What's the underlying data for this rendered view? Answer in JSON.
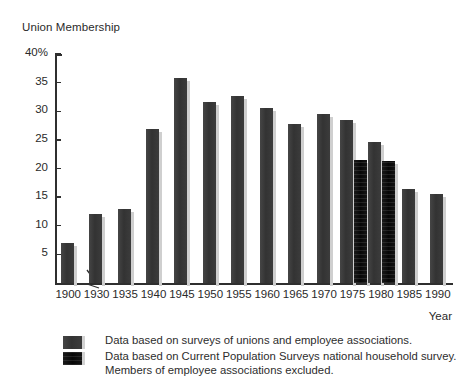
{
  "chart_data": {
    "type": "bar",
    "title": "Union Membership",
    "xlabel": "Year",
    "ylabel": "",
    "ylim": [
      0,
      40
    ],
    "yticks": [
      40,
      35,
      30,
      25,
      20,
      15,
      10,
      5
    ],
    "ytick_labels": [
      "40%",
      "35",
      "30",
      "25",
      "20",
      "15",
      "10",
      "5"
    ],
    "grid": false,
    "axis_break_after_category": "1900",
    "legend_position": "below-plot",
    "categories": [
      "1900",
      "1930",
      "1935",
      "1940",
      "1945",
      "1950",
      "1955",
      "1960",
      "1965",
      "1970",
      "1975",
      "1980",
      "1985",
      "1990"
    ],
    "series": [
      {
        "name": "Data based on surveys of unions and employee associations.",
        "key": "unions",
        "color": "#3a3a3a",
        "values": [
          7.0,
          12.0,
          13.0,
          26.9,
          35.8,
          31.7,
          32.6,
          30.6,
          27.7,
          29.6,
          28.4,
          24.7,
          16.5,
          15.5
        ]
      },
      {
        "name": "Data based on Current Population Surveys national household survey. Members of employee associations excluded.",
        "key": "cps",
        "color": "#111111",
        "values": [
          null,
          null,
          null,
          null,
          null,
          null,
          null,
          null,
          null,
          null,
          21.5,
          21.3,
          null,
          null
        ]
      }
    ]
  },
  "legend": {
    "entries": [
      {
        "label": "Data based on surveys of unions and employee associations.",
        "swatch": "unions"
      },
      {
        "label": "Data based on Current Population Surveys national household survey.",
        "swatch": "cps"
      },
      {
        "label": "Members of employee associations excluded.",
        "swatch": null
      }
    ]
  },
  "colors": {
    "series_unions": "#3a3a3a",
    "series_cps": "#111111",
    "axis": "#2f2f2f",
    "text": "#2a2a2a",
    "background": "#ffffff",
    "bar_shadow": "#cfcfcf"
  }
}
